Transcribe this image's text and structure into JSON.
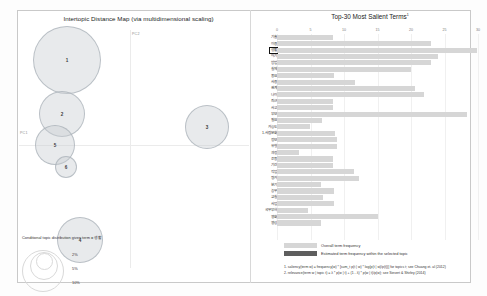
{
  "left_panel": {
    "title": "Intertopic Distance Map (via multidimensional scaling)",
    "axis_x_label": "PC1",
    "axis_y_label": "PC2",
    "topics": [
      {
        "id": "1",
        "cx": 67,
        "cy": 60,
        "r": 34
      },
      {
        "id": "2",
        "cx": 62,
        "cy": 114,
        "r": 23
      },
      {
        "id": "5",
        "cx": 55,
        "cy": 145,
        "r": 20
      },
      {
        "id": "6",
        "cx": 66,
        "cy": 167,
        "r": 11
      },
      {
        "id": "4",
        "cx": 80,
        "cy": 240,
        "r": 23
      },
      {
        "id": "3",
        "cx": 207,
        "cy": 127,
        "r": 22
      }
    ],
    "legend": {
      "caption": "Conditional topic distribution given term = 생활",
      "sizes": [
        "2%",
        "5%",
        "10%"
      ]
    }
  },
  "right_panel": {
    "title": "Top-30 Most Salient Terms",
    "title_superscript": "1",
    "x_ticks": [
      0,
      5,
      10,
      15,
      20,
      25,
      30
    ],
    "x_max": 30,
    "selected_term": "생활",
    "legend": {
      "overall_label": "Overall term frequency",
      "selected_label": "Estimated term frequency within the selected topic"
    },
    "notes": [
      "1. saliency(term w) = frequency(w) * [sum_t p(t | w) * log(p(t | w)/p(t))] for topics t; see Chuang et. al (2012)",
      "2. relevance(term w | topic t) = λ * p(w | t) + (1 - λ) * p(w | t)/p(w); see Sievert & Shirley (2014)"
    ]
  },
  "chart_data": {
    "type": "bar",
    "title": "Top-30 Most Salient Terms",
    "xlabel": "",
    "ylabel": "",
    "xlim": [
      0,
      30
    ],
    "grid": true,
    "legend_position": "bottom",
    "orientation": "horizontal",
    "categories": [
      "기술",
      "이용",
      "생활",
      "아기",
      "방법",
      "실제",
      "중요",
      "사용",
      "관계",
      "나이",
      "최근",
      "사고",
      "부모",
      "필요",
      "가능도",
      "1.사람문화",
      "정보",
      "유형",
      "과정",
      "운동",
      "기간",
      "작업",
      "평가",
      "분기",
      "농무",
      "교실",
      "사업",
      "국무부하",
      "영화",
      "영상"
    ],
    "series": [
      {
        "name": "Overall term frequency",
        "values": [
          8.4,
          23.0,
          29.9,
          24.1,
          23.0,
          20.0,
          8.5,
          11.6,
          20.6,
          22.0,
          8.3,
          8.4,
          28.4,
          6.7,
          4.9,
          8.6,
          8.9,
          8.9,
          3.3,
          8.4,
          8.4,
          11.5,
          12.2,
          6.6,
          8.5,
          6.8,
          8.5,
          4.6,
          15.1,
          6.5
        ]
      },
      {
        "name": "Estimated term frequency within the selected topic",
        "values": [
          0,
          0,
          0,
          0,
          0,
          0,
          0,
          0,
          0,
          0,
          0,
          0,
          0,
          0,
          0,
          0,
          0,
          0,
          0,
          0,
          0,
          0,
          0,
          0,
          0,
          0,
          0,
          0,
          0,
          0
        ]
      }
    ]
  }
}
